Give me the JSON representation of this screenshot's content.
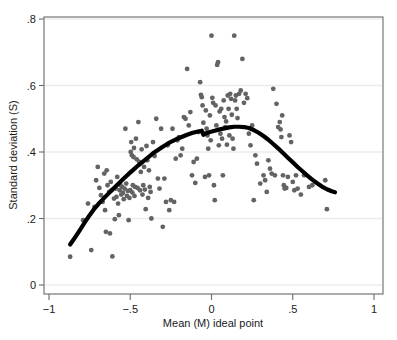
{
  "chart_data": {
    "type": "scatter",
    "title": "",
    "xlabel": "Mean (M) ideal point",
    "ylabel": "Standard deviation (S)",
    "xlim": [
      -1,
      1
    ],
    "ylim": [
      0,
      0.8
    ],
    "xticks": [
      -1,
      -0.5,
      0,
      0.5,
      1
    ],
    "xtick_labels": [
      "−1",
      "−.5",
      "0",
      ".5",
      "1"
    ],
    "yticks": [
      0,
      0.2,
      0.4,
      0.6,
      0.8
    ],
    "ytick_labels": [
      "0",
      ".2",
      ".4",
      ".6",
      ".8"
    ],
    "grid": "horizontal",
    "grid_color": "#ececec",
    "legend": "none",
    "point_color": "#636363",
    "point_size": 2.4,
    "frame_color": "#666666",
    "series": [
      {
        "name": "observations",
        "type": "scatter",
        "x": [
          -0.87,
          -0.79,
          -0.76,
          -0.74,
          -0.72,
          -0.71,
          -0.7,
          -0.69,
          -0.68,
          -0.67,
          -0.66,
          -0.655,
          -0.65,
          -0.645,
          -0.64,
          -0.63,
          -0.625,
          -0.62,
          -0.615,
          -0.61,
          -0.6,
          -0.595,
          -0.59,
          -0.585,
          -0.58,
          -0.575,
          -0.57,
          -0.565,
          -0.56,
          -0.555,
          -0.55,
          -0.545,
          -0.54,
          -0.535,
          -0.53,
          -0.525,
          -0.52,
          -0.515,
          -0.51,
          -0.505,
          -0.5,
          -0.497,
          -0.494,
          -0.49,
          -0.487,
          -0.484,
          -0.48,
          -0.477,
          -0.474,
          -0.47,
          -0.465,
          -0.46,
          -0.455,
          -0.45,
          -0.445,
          -0.44,
          -0.435,
          -0.43,
          -0.425,
          -0.42,
          -0.415,
          -0.41,
          -0.405,
          -0.4,
          -0.395,
          -0.39,
          -0.385,
          -0.38,
          -0.375,
          -0.37,
          -0.36,
          -0.35,
          -0.34,
          -0.33,
          -0.32,
          -0.31,
          -0.3,
          -0.29,
          -0.28,
          -0.27,
          -0.26,
          -0.25,
          -0.24,
          -0.23,
          -0.22,
          -0.21,
          -0.2,
          -0.19,
          -0.18,
          -0.17,
          -0.16,
          -0.15,
          -0.14,
          -0.13,
          -0.12,
          -0.11,
          -0.1,
          -0.09,
          -0.08,
          -0.07,
          -0.065,
          -0.06,
          -0.055,
          -0.05,
          -0.045,
          -0.04,
          -0.035,
          -0.03,
          -0.025,
          -0.02,
          -0.015,
          -0.01,
          -0.005,
          0.0,
          0.005,
          0.01,
          0.015,
          0.02,
          0.025,
          0.03,
          0.035,
          0.04,
          0.045,
          0.05,
          0.055,
          0.06,
          0.065,
          0.07,
          0.075,
          0.08,
          0.085,
          0.09,
          0.095,
          0.1,
          0.105,
          0.11,
          0.115,
          0.12,
          0.125,
          0.13,
          0.135,
          0.14,
          0.145,
          0.15,
          0.155,
          0.16,
          0.17,
          0.18,
          0.19,
          0.2,
          0.21,
          0.22,
          0.23,
          0.24,
          0.25,
          0.26,
          0.27,
          0.28,
          0.3,
          0.32,
          0.33,
          0.34,
          0.35,
          0.36,
          0.37,
          0.38,
          0.39,
          0.4,
          0.41,
          0.42,
          0.425,
          0.43,
          0.435,
          0.44,
          0.445,
          0.45,
          0.46,
          0.47,
          0.48,
          0.49,
          0.5,
          0.51,
          0.52,
          0.53,
          0.55,
          0.57,
          0.6,
          0.62,
          0.7,
          0.71
        ],
        "y": [
          0.085,
          0.195,
          0.245,
          0.105,
          0.235,
          0.315,
          0.355,
          0.292,
          0.27,
          0.25,
          0.335,
          0.225,
          0.16,
          0.345,
          0.3,
          0.28,
          0.155,
          0.31,
          0.285,
          0.086,
          0.26,
          0.198,
          0.29,
          0.265,
          0.325,
          0.245,
          0.21,
          0.285,
          0.3,
          0.272,
          0.295,
          0.277,
          0.258,
          0.29,
          0.47,
          0.305,
          0.268,
          0.283,
          0.195,
          0.262,
          0.285,
          0.4,
          0.43,
          0.39,
          0.278,
          0.3,
          0.385,
          0.412,
          0.268,
          0.295,
          0.44,
          0.378,
          0.292,
          0.49,
          0.37,
          0.285,
          0.34,
          0.408,
          0.272,
          0.3,
          0.355,
          0.287,
          0.228,
          0.418,
          0.375,
          0.262,
          0.345,
          0.295,
          0.28,
          0.2,
          0.43,
          0.388,
          0.5,
          0.32,
          0.29,
          0.47,
          0.175,
          0.32,
          0.25,
          0.42,
          0.225,
          0.255,
          0.47,
          0.25,
          0.38,
          0.435,
          0.445,
          0.39,
          0.41,
          0.505,
          0.5,
          0.65,
          0.48,
          0.52,
          0.33,
          0.37,
          0.307,
          0.38,
          0.46,
          0.61,
          0.572,
          0.565,
          0.54,
          0.488,
          0.455,
          0.325,
          0.525,
          0.47,
          0.45,
          0.41,
          0.33,
          0.51,
          0.435,
          0.75,
          0.563,
          0.548,
          0.3,
          0.255,
          0.54,
          0.48,
          0.662,
          0.67,
          0.42,
          0.522,
          0.455,
          0.53,
          0.44,
          0.33,
          0.555,
          0.505,
          0.475,
          0.492,
          0.422,
          0.57,
          0.53,
          0.45,
          0.575,
          0.56,
          0.512,
          0.44,
          0.41,
          0.75,
          0.555,
          0.57,
          0.53,
          0.502,
          0.575,
          0.585,
          0.68,
          0.548,
          0.575,
          0.562,
          0.455,
          0.42,
          0.48,
          0.255,
          0.39,
          0.365,
          0.305,
          0.33,
          0.315,
          0.28,
          0.375,
          0.35,
          0.335,
          0.59,
          0.33,
          0.545,
          0.475,
          0.49,
          0.468,
          0.445,
          0.51,
          0.33,
          0.3,
          0.29,
          0.292,
          0.325,
          0.45,
          0.43,
          0.31,
          0.285,
          0.33,
          0.29,
          0.272,
          0.33,
          0.295,
          0.3,
          0.315,
          0.228
        ]
      },
      {
        "name": "lowess-fit",
        "type": "line",
        "color": "#000000",
        "width": 4.2,
        "x": [
          -0.87,
          -0.84,
          -0.81,
          -0.78,
          -0.75,
          -0.72,
          -0.69,
          -0.66,
          -0.63,
          -0.6,
          -0.57,
          -0.54,
          -0.51,
          -0.48,
          -0.45,
          -0.42,
          -0.39,
          -0.36,
          -0.33,
          -0.3,
          -0.27,
          -0.24,
          -0.21,
          -0.18,
          -0.15,
          -0.12,
          -0.09,
          -0.06,
          -0.05,
          -0.04,
          -0.01,
          0.02,
          0.05,
          0.08,
          0.11,
          0.14,
          0.17,
          0.2,
          0.23,
          0.26,
          0.29,
          0.32,
          0.35,
          0.38,
          0.41,
          0.44,
          0.47,
          0.5,
          0.53,
          0.56,
          0.59,
          0.62,
          0.65,
          0.68,
          0.71,
          0.74,
          0.76
        ],
        "y": [
          0.122,
          0.143,
          0.165,
          0.188,
          0.21,
          0.23,
          0.247,
          0.262,
          0.277,
          0.292,
          0.306,
          0.32,
          0.334,
          0.347,
          0.36,
          0.372,
          0.384,
          0.396,
          0.406,
          0.416,
          0.425,
          0.433,
          0.44,
          0.446,
          0.452,
          0.457,
          0.461,
          0.464,
          0.452,
          0.455,
          0.46,
          0.464,
          0.468,
          0.471,
          0.474,
          0.476,
          0.476,
          0.475,
          0.472,
          0.466,
          0.458,
          0.448,
          0.437,
          0.424,
          0.411,
          0.397,
          0.383,
          0.369,
          0.355,
          0.342,
          0.329,
          0.317,
          0.306,
          0.296,
          0.288,
          0.282,
          0.279
        ]
      }
    ]
  },
  "axes": {
    "x_label": "Mean (M) ideal point",
    "y_label": "Standard deviation (S)"
  }
}
